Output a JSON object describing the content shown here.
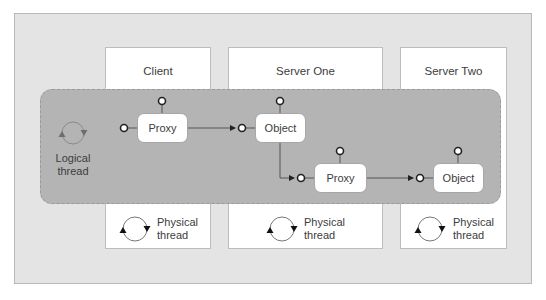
{
  "diagram": {
    "columns": [
      {
        "id": "client",
        "title": "Client"
      },
      {
        "id": "server-one",
        "title": "Server One"
      },
      {
        "id": "server-two",
        "title": "Server Two"
      }
    ],
    "logical_thread": {
      "label_line1": "Logical",
      "label_line2": "thread"
    },
    "physical_thread": {
      "label_line1": "Physical",
      "label_line2": "thread"
    },
    "nodes": [
      {
        "id": "proxy-1",
        "label": "Proxy",
        "column": "client"
      },
      {
        "id": "object-1",
        "label": "Object",
        "column": "server-one"
      },
      {
        "id": "proxy-2",
        "label": "Proxy",
        "column": "server-one"
      },
      {
        "id": "object-2",
        "label": "Object",
        "column": "server-two"
      }
    ],
    "edges": [
      {
        "from": "proxy-1",
        "to": "object-1"
      },
      {
        "from": "object-1",
        "to": "proxy-2"
      },
      {
        "from": "proxy-2",
        "to": "object-2"
      }
    ],
    "colors": {
      "outer_bg": "#e4e4e4",
      "column_bg": "#ffffff",
      "logical_band": "#b4b4b4",
      "node_bg": "#ffffff",
      "line": "#555555"
    }
  }
}
